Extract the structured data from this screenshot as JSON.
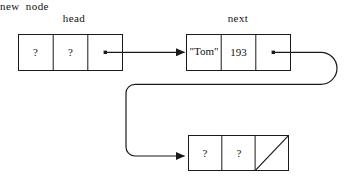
{
  "diagram": {
    "stroke_color": "#1a1a1a",
    "background_color": "#ffffff",
    "nodes": [
      {
        "id": "head",
        "label": "head",
        "x": 18,
        "y": 34,
        "width": 104,
        "height": 36,
        "cells": [
          {
            "text": "?",
            "kind": "unknown"
          },
          {
            "text": "?",
            "kind": "unknown"
          },
          {
            "text": "",
            "kind": "pointer"
          }
        ]
      },
      {
        "id": "next",
        "label": "next",
        "x": 186,
        "y": 34,
        "width": 104,
        "height": 36,
        "cells": [
          {
            "text": "\"Tom\"",
            "kind": "value"
          },
          {
            "text": "193",
            "kind": "value"
          },
          {
            "text": "",
            "kind": "pointer"
          }
        ]
      },
      {
        "id": "new-node",
        "label": "new  node",
        "x": 188,
        "y": 135,
        "width": 100,
        "height": 35,
        "cells": [
          {
            "text": "?",
            "kind": "unknown"
          },
          {
            "text": "?",
            "kind": "unknown"
          },
          {
            "text": "",
            "kind": "null"
          }
        ]
      }
    ],
    "edges": [
      {
        "id": "head-to-next",
        "from": "head.pointer",
        "to": "next.left",
        "style": "straight-arrow"
      },
      {
        "id": "next-to-new-node",
        "from": "next.pointer",
        "to": "new-node.left",
        "style": "curved-loop-arrow"
      }
    ]
  }
}
